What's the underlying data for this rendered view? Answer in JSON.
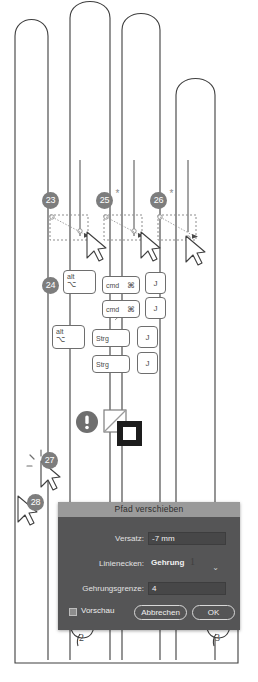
{
  "illustration": {
    "title": "Pfad verschieben Tutorial Schritte",
    "shape_name": "hand-outline-path"
  },
  "badges": [
    {
      "id": "23",
      "label": "23",
      "star": false
    },
    {
      "id": "25",
      "label": "25",
      "star": true
    },
    {
      "id": "26",
      "label": "26",
      "star": true
    },
    {
      "id": "24",
      "label": "24",
      "star": false
    },
    {
      "id": "27",
      "label": "27",
      "star": false
    },
    {
      "id": "28",
      "label": "28",
      "star": false
    }
  ],
  "shortcuts": {
    "rows": [
      {
        "keys": [
          {
            "name": "alt-key",
            "main": "alt",
            "sym": "⌥"
          },
          {
            "name": "cmd-key",
            "main": "cmd",
            "right": "⌘"
          },
          {
            "name": "j-key",
            "center": "J"
          }
        ]
      },
      {
        "keys": [
          {
            "name": "cmd-key",
            "main": "cmd",
            "right": "⌘"
          },
          {
            "name": "j-key",
            "center": "J"
          }
        ]
      },
      {
        "keys": [
          {
            "name": "alt-key",
            "main": "alt",
            "sym": "⌥"
          },
          {
            "name": "strg-key",
            "main": "Strg"
          },
          {
            "name": "j-key",
            "center": "J"
          }
        ]
      },
      {
        "keys": [
          {
            "name": "strg-key",
            "main": "Strg"
          },
          {
            "name": "j-key",
            "center": "J"
          }
        ]
      }
    ]
  },
  "icons": {
    "warning": "warning-circle-icon",
    "fill_swatch": "fill-none-swatch",
    "stroke_swatch": "stroke-swatch",
    "click_burst": "click-burst-icon",
    "arrow_cursor": "arrow-cursor-icon",
    "hand_cursor": "hand-pointer-cursor-icon",
    "chevron_down": "chevron-down-icon"
  },
  "dialog": {
    "title": "Pfad verschieben",
    "fields": [
      {
        "label": "Versatz:",
        "value": "-7 mm",
        "name": "offset-field",
        "bold": false
      },
      {
        "label": "Linienecken:",
        "value": "Gehrung",
        "name": "joins-select",
        "bold": true
      },
      {
        "label": "Gehrungsgrenze:",
        "value": "4",
        "name": "miter-limit-field",
        "bold": false
      }
    ],
    "dropdown_glyph": "⌄",
    "preview_label": "Vorschau",
    "cancel_label": "Abbrechen",
    "ok_label": "OK"
  },
  "cursor_numbers": [
    {
      "label": "1"
    },
    {
      "label": "2"
    },
    {
      "label": "3"
    }
  ],
  "colors": {
    "badge_bg": "#7d7d7d",
    "dialog_bg": "#555556",
    "titlebar_bg": "#9a9a9a",
    "field_bg": "#474748",
    "path_stroke": "#3f3f3f"
  }
}
